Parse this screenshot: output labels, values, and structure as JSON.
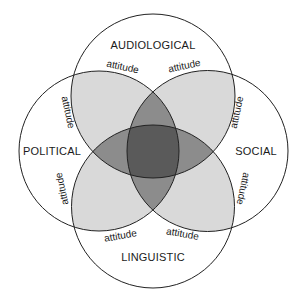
{
  "diagram": {
    "type": "venn",
    "sets": [
      {
        "id": "audiological",
        "label": "AUDIOLOGICAL",
        "position": "top"
      },
      {
        "id": "social",
        "label": "SOCIAL",
        "position": "right"
      },
      {
        "id": "linguistic",
        "label": "LINGUISTIC",
        "position": "bottom"
      },
      {
        "id": "political",
        "label": "POLITICAL",
        "position": "left"
      }
    ],
    "overlap_labels": [
      {
        "text": "attitude",
        "between": "audiological-political",
        "side": "top-left"
      },
      {
        "text": "attitude",
        "between": "audiological-social",
        "side": "top-right"
      },
      {
        "text": "attitude",
        "between": "political-audiological",
        "side": "left-upper"
      },
      {
        "text": "attitude",
        "between": "social-audiological",
        "side": "right-upper"
      },
      {
        "text": "attitude",
        "between": "political-linguistic",
        "side": "left-lower"
      },
      {
        "text": "attitude",
        "between": "social-linguistic",
        "side": "right-lower"
      },
      {
        "text": "attitude",
        "between": "linguistic-political",
        "side": "bottom-left"
      },
      {
        "text": "attitude",
        "between": "linguistic-social",
        "side": "bottom-right"
      }
    ],
    "colors": {
      "background": "#ffffff",
      "stroke": "#222222",
      "single_overlap": "#d9d9d9",
      "double_overlap": "#8c8c8c",
      "center": "#5a5a5a"
    }
  }
}
